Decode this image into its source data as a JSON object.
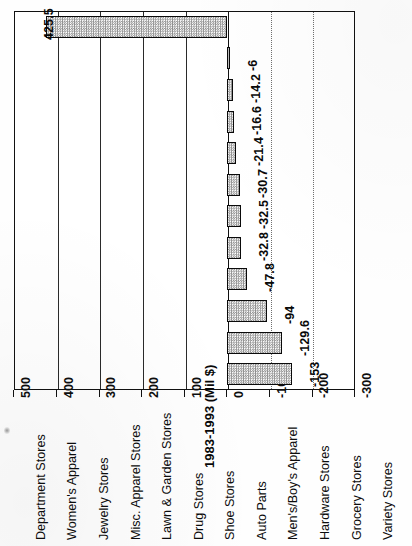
{
  "chart_data": {
    "type": "bar",
    "title": "",
    "subtitle": "",
    "orientation": "rotated-90-ccw",
    "xlabel": "",
    "ylabel": "1983-1993 (Mil $)",
    "ylim": [
      -300,
      500
    ],
    "ytick_step": 100,
    "grid": true,
    "legend": "none",
    "categories": [
      "Department Stores",
      "Women's Apparel",
      "Jewelry Stores",
      "Misc. Apparel Stores",
      "Lawn & Garden Stores",
      "Drug Stores",
      "Shoe Stores",
      "Auto Parts",
      "Men's/Boy's Apparel",
      "Hardware Stores",
      "Grocery Stores",
      "Variety Stores"
    ],
    "values": [
      425.5,
      -6,
      -14.2,
      -16.6,
      -21.4,
      -30.7,
      -32.5,
      -32.8,
      -47.8,
      -94,
      -129.6,
      -153
    ],
    "value_labels": [
      "425.5",
      "-6",
      "-14.2",
      "-16.6",
      "-21.4",
      "-30.7",
      "-32.5",
      "-32.8",
      "-47.8",
      "-94",
      "-129.6",
      "-153"
    ],
    "tick_labels": [
      "500",
      "400",
      "300",
      "200",
      "100",
      "0",
      "-100",
      "-200",
      "-300"
    ],
    "tick_values": [
      500,
      400,
      300,
      200,
      100,
      0,
      -100,
      -200,
      -300
    ],
    "bar_fill_color": "#c9c9c9",
    "bar_edge_color": "#0a0a0a",
    "grid_color": "#2a2a2a",
    "text_color": "#0d0d0d",
    "background_color": "#ffffff"
  }
}
